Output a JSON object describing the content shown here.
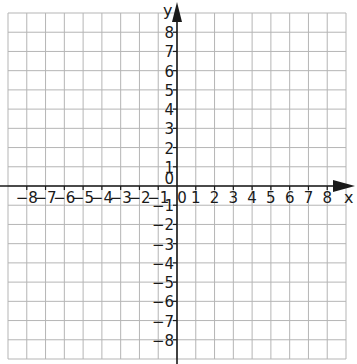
{
  "chart_data": {
    "type": "scatter",
    "title": "",
    "xlabel": "x",
    "ylabel": "y",
    "xlim": [
      -9,
      9
    ],
    "ylim": [
      -9,
      9
    ],
    "grid": true,
    "grid_step": 1,
    "x_ticks": [
      -8,
      -7,
      -6,
      -5,
      -4,
      -3,
      -2,
      -1,
      0,
      1,
      2,
      3,
      4,
      5,
      6,
      7,
      8
    ],
    "y_ticks": [
      8,
      7,
      6,
      5,
      4,
      3,
      2,
      1,
      0,
      -1,
      -2,
      -3,
      -4,
      -5,
      -6,
      -7,
      -8
    ],
    "x_tick_labels": [
      "−8",
      "−7",
      "−6",
      "−5",
      "−4",
      "−3",
      "−2",
      "−1",
      "0",
      "1",
      "2",
      "3",
      "4",
      "5",
      "6",
      "7",
      "8"
    ],
    "y_tick_labels": [
      "8",
      "7",
      "6",
      "5",
      "4",
      "3",
      "2",
      "1",
      "0",
      "−1",
      "−2",
      "−3",
      "−4",
      "−5",
      "−6",
      "−7",
      "−8"
    ],
    "origin_label": "0",
    "series": [],
    "legend": null
  },
  "colors": {
    "grid": "#b5b5b5",
    "axis": "#1a1a1a",
    "background": "#ffffff"
  }
}
